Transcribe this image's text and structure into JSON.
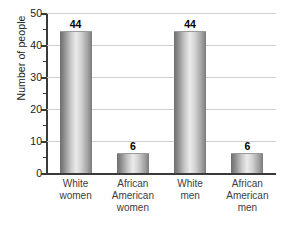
{
  "chart_data": {
    "type": "bar",
    "title": "",
    "xlabel": "",
    "ylabel": "Number of people",
    "categories": [
      "White women",
      "African American women",
      "White men",
      "African American men"
    ],
    "category_lines": [
      [
        "White",
        "women"
      ],
      [
        "African",
        "American",
        "women"
      ],
      [
        "White",
        "men"
      ],
      [
        "African",
        "American",
        "men"
      ]
    ],
    "values": [
      44,
      6,
      44,
      6
    ],
    "value_labels": [
      "44",
      "6",
      "44",
      "6"
    ],
    "ylim": [
      0,
      50
    ],
    "y_major_ticks": [
      0,
      10,
      20,
      30,
      40,
      50
    ],
    "y_tick_labels": [
      "0",
      "10",
      "20",
      "30",
      "40",
      "50"
    ],
    "y_minor_ticks": [
      5,
      15,
      25,
      35,
      45
    ],
    "grid": "horizontal",
    "legend": "none",
    "colors": {
      "bar_edge": "#6e6e6e",
      "bar_highlight": "#ebebeb",
      "gridline": "#cfcfcf",
      "axis": "#3a3a3a",
      "tick_text": "#1b1b1b",
      "category_text": "#3d3d3d",
      "value_text": "#000000",
      "background": "#ffffff"
    }
  }
}
